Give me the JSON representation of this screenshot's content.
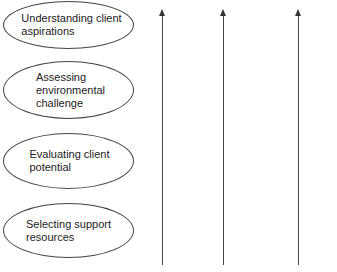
{
  "diagram": {
    "stages": [
      {
        "label": "Understanding client\naspirations"
      },
      {
        "label": "Assessing\nenvironmental\nchallenge"
      },
      {
        "label": "Evaluating client\npotential"
      },
      {
        "label": "Selecting support\nresources"
      }
    ],
    "arrows": [
      {
        "direction": "up"
      },
      {
        "direction": "up"
      },
      {
        "direction": "up"
      }
    ],
    "colors": {
      "stroke": "#444444",
      "text": "#222222",
      "background": "#ffffff"
    }
  }
}
